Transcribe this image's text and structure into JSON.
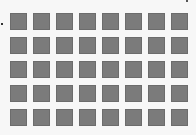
{
  "grid": {
    "columns": 8,
    "rows": 5,
    "tile_color": "#7b7b7b",
    "tile_border_color": "#6c6c6c",
    "background_color": "#f7f7f7",
    "tiles": [
      {
        "row": 1,
        "col": 1
      },
      {
        "row": 1,
        "col": 2
      },
      {
        "row": 1,
        "col": 3
      },
      {
        "row": 1,
        "col": 4
      },
      {
        "row": 1,
        "col": 5
      },
      {
        "row": 1,
        "col": 6
      },
      {
        "row": 1,
        "col": 7
      },
      {
        "row": 1,
        "col": 8
      },
      {
        "row": 2,
        "col": 1
      },
      {
        "row": 2,
        "col": 2
      },
      {
        "row": 2,
        "col": 3
      },
      {
        "row": 2,
        "col": 4
      },
      {
        "row": 2,
        "col": 5
      },
      {
        "row": 2,
        "col": 6
      },
      {
        "row": 2,
        "col": 7
      },
      {
        "row": 2,
        "col": 8
      },
      {
        "row": 3,
        "col": 1
      },
      {
        "row": 3,
        "col": 2
      },
      {
        "row": 3,
        "col": 3
      },
      {
        "row": 3,
        "col": 4
      },
      {
        "row": 3,
        "col": 5
      },
      {
        "row": 3,
        "col": 6
      },
      {
        "row": 3,
        "col": 7
      },
      {
        "row": 3,
        "col": 8
      },
      {
        "row": 4,
        "col": 1
      },
      {
        "row": 4,
        "col": 2
      },
      {
        "row": 4,
        "col": 3
      },
      {
        "row": 4,
        "col": 4
      },
      {
        "row": 4,
        "col": 5
      },
      {
        "row": 4,
        "col": 6
      },
      {
        "row": 4,
        "col": 7
      },
      {
        "row": 4,
        "col": 8
      },
      {
        "row": 5,
        "col": 1
      },
      {
        "row": 5,
        "col": 2
      },
      {
        "row": 5,
        "col": 3
      },
      {
        "row": 5,
        "col": 4
      },
      {
        "row": 5,
        "col": 5
      },
      {
        "row": 5,
        "col": 6
      },
      {
        "row": 5,
        "col": 7
      },
      {
        "row": 5,
        "col": 8
      }
    ]
  },
  "markers": [
    {
      "name": "left-dot",
      "color": "#333333"
    },
    {
      "name": "top-right-dot",
      "color": "#555555"
    }
  ]
}
